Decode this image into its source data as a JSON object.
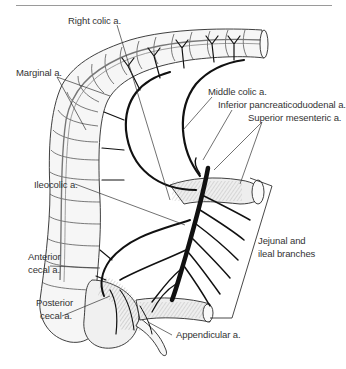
{
  "figure": {
    "type": "anatomical illustration",
    "labels": {
      "right_colic": "Right colic a.",
      "marginal": "Marginal a.",
      "middle_colic": "Middle colic a.",
      "inferior_pancreaticoduodenal": "Inferior pancreaticoduodenal a.",
      "superior_mesenteric": "Superior mesenteric a.",
      "ileocolic": "Ileocolic a.",
      "jejunal_ileal_line1": "Jejunal and",
      "jejunal_ileal_line2": "ileal branches",
      "anterior_cecal_line1": "Anterior",
      "anterior_cecal_line2": "cecal a.",
      "posterior_cecal_line1": "Posterior",
      "posterior_cecal_line2": "cecal a.",
      "appendicular": "Appendicular a."
    },
    "colors": {
      "ink": "#1a1a1a",
      "vessel": "#111111",
      "bowel_fill": "#f4f4f4",
      "leader": "#333333",
      "rule": "#9a9a9a"
    }
  }
}
